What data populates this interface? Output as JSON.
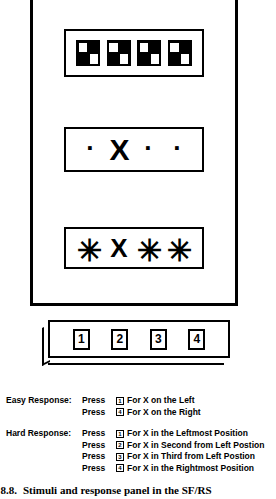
{
  "figure": {
    "stimulus_panel": {
      "name": "stimulus-panel",
      "windows": [
        {
          "name": "checkerboard-window",
          "type": "checkerboard",
          "items": [
            "checker-glyph",
            "checker-glyph",
            "checker-glyph",
            "checker-glyph"
          ]
        },
        {
          "name": "easy-stimulus-window",
          "type": "marks",
          "items": [
            "·",
            "X",
            "·",
            "·"
          ]
        },
        {
          "name": "hard-stimulus-window",
          "type": "marks",
          "items": [
            "✳",
            "X",
            "✳",
            "✳"
          ]
        }
      ]
    },
    "response_box": {
      "name": "response-button-box",
      "keys": [
        "1",
        "2",
        "3",
        "4"
      ]
    }
  },
  "instructions": [
    {
      "label": "Easy Response:",
      "lines": [
        {
          "press": "Press",
          "key": "1",
          "text": "For X on the Left"
        },
        {
          "press": "Press",
          "key": "4",
          "text": "For X on the Right"
        }
      ]
    },
    {
      "label": "Hard Response:",
      "lines": [
        {
          "press": "Press",
          "key": "1",
          "text": "For X in the Leftmost Position"
        },
        {
          "press": "Press",
          "key": "2",
          "text": "For X in Second from Left Postion"
        },
        {
          "press": "Press",
          "key": "3",
          "text": "For X in Third from Left Postion"
        },
        {
          "press": "Press",
          "key": "4",
          "text": "For X in the Rightmost Position"
        }
      ]
    }
  ],
  "caption": {
    "number": "ure 8.8.",
    "text": "Stimuli and response panel in the SF/RS"
  }
}
